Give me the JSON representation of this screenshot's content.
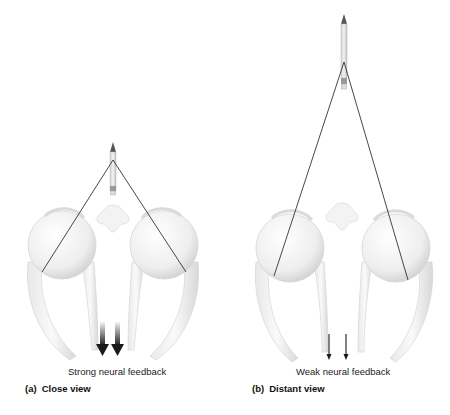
{
  "figure": {
    "panels": [
      {
        "id": "a",
        "letter": "(a)",
        "title": "Close view",
        "caption": "Strong neural feedback",
        "feedback_strength": "strong",
        "arrow_count": 2
      },
      {
        "id": "b",
        "letter": "(b)",
        "title": "Distant view",
        "caption": "Weak neural feedback",
        "feedback_strength": "weak",
        "arrow_count": 2
      }
    ],
    "colors": {
      "background": "#ffffff",
      "eye_fill": "#f2f2f2",
      "eye_shade": "#d6d6d6",
      "sight_line": "#333333",
      "arrow": "#1a1a1a",
      "text": "#222222"
    }
  }
}
